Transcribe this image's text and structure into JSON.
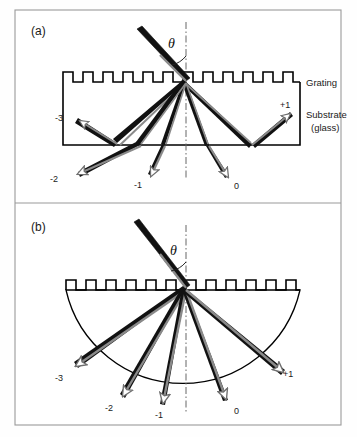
{
  "figure": {
    "background": "#fefefe",
    "border_color": "#9a9a9a",
    "panels": [
      {
        "id": "a",
        "label": "(a)",
        "substrate_shape": "rectangular-slab",
        "annotations": [
          {
            "name": "grating-label",
            "text": "Grating"
          },
          {
            "name": "substrate-label-line1",
            "text": "Substrate"
          },
          {
            "name": "substrate-label-line2",
            "text": "(glass)"
          }
        ],
        "angle_symbol": "θ",
        "normal_style": "dash-dot",
        "grating_teeth": 12,
        "diffraction_orders": [
          {
            "label": "-3",
            "x": 63,
            "y": 118
          },
          {
            "label": "-2",
            "x": 57,
            "y": 178
          },
          {
            "label": "-1",
            "x": 140,
            "y": 183
          },
          {
            "label": "0",
            "x": 239,
            "y": 183
          },
          {
            "label": "+1",
            "x": 286,
            "y": 107
          }
        ]
      },
      {
        "id": "b",
        "label": "(b)",
        "substrate_shape": "hemispherical-lens",
        "annotations": [],
        "angle_symbol": "θ",
        "normal_style": "dash-dot",
        "grating_teeth": 12,
        "diffraction_orders": [
          {
            "label": "-3",
            "x": 61,
            "y": 377
          },
          {
            "label": "-2",
            "x": 111,
            "y": 407
          },
          {
            "label": "-1",
            "x": 160,
            "y": 414
          },
          {
            "label": "0",
            "x": 239,
            "y": 410
          },
          {
            "label": "+1",
            "x": 289,
            "y": 375
          }
        ]
      }
    ],
    "colors": {
      "ray_dark": "#111111",
      "ray_gray": "#808080",
      "outline": "#000000",
      "normal_line": "#555555",
      "panel_border": "#9a9a9a"
    }
  }
}
